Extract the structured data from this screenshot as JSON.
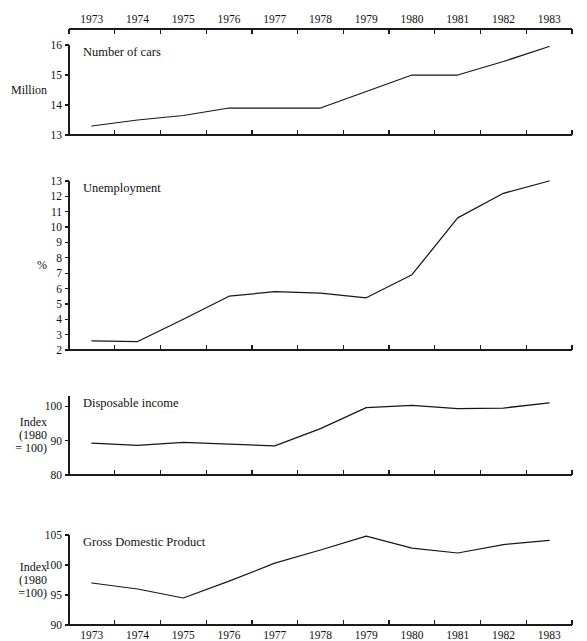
{
  "figure": {
    "background_color": "#ffffff",
    "line_color": "#17171a",
    "axis_color": "#1a1a1a",
    "years": [
      "1973",
      "1974",
      "1975",
      "1976",
      "1977",
      "1978",
      "1979",
      "1980",
      "1981",
      "1982",
      "1983"
    ],
    "top_axis_years": [
      "1973",
      "1974",
      "1975",
      "1976",
      "1977",
      "1978",
      "1979",
      "1980",
      "1981",
      "1982",
      "1983"
    ],
    "bottom_axis_years": [
      "1973",
      "1974",
      "1975",
      "1976",
      "1977",
      "1978",
      "1979",
      "1980",
      "1981",
      "1982",
      "1983"
    ]
  },
  "chart_data": [
    {
      "type": "line",
      "title": "Number of cars",
      "xlabel": "",
      "ylabel": "Million",
      "ylabel_lines": [
        "Million"
      ],
      "categories": [
        "1973",
        "1974",
        "1975",
        "1976",
        "1977",
        "1978",
        "1979",
        "1980",
        "1981",
        "1982",
        "1983"
      ],
      "values": [
        13.3,
        13.5,
        13.65,
        13.9,
        13.9,
        13.9,
        14.45,
        15.0,
        15.0,
        15.45,
        15.95
      ],
      "ylim": [
        13,
        16
      ],
      "yticks": [
        13,
        14,
        15,
        16
      ],
      "ytick_labels": [
        "13",
        "14",
        "15",
        "16"
      ],
      "grid": false,
      "legend": "none",
      "axis_position": "top"
    },
    {
      "type": "line",
      "title": "Unemployment",
      "xlabel": "",
      "ylabel": "%",
      "ylabel_lines": [
        "%"
      ],
      "categories": [
        "1973",
        "1974",
        "1975",
        "1976",
        "1977",
        "1978",
        "1979",
        "1980",
        "1981",
        "1982",
        "1983"
      ],
      "values": [
        2.6,
        2.55,
        4.0,
        5.5,
        5.8,
        5.7,
        5.4,
        6.9,
        10.6,
        12.2,
        13.0
      ],
      "ylim": [
        2,
        13
      ],
      "yticks": [
        2,
        3,
        4,
        5,
        6,
        7,
        8,
        9,
        10,
        11,
        12,
        13
      ],
      "ytick_labels": [
        "2",
        "3",
        "4",
        "5",
        "6",
        "7",
        "8",
        "9",
        "10",
        "11",
        "12",
        "13"
      ],
      "grid": false,
      "legend": "none",
      "axis_position": "none"
    },
    {
      "type": "line",
      "title": "Disposable income",
      "xlabel": "",
      "ylabel": "Index (1980 = 100)",
      "ylabel_lines": [
        "Index",
        "(1980",
        "= 100)"
      ],
      "categories": [
        "1973",
        "1974",
        "1975",
        "1976",
        "1977",
        "1978",
        "1979",
        "1980",
        "1981",
        "1982",
        "1983"
      ],
      "values": [
        89.3,
        88.6,
        89.5,
        89.0,
        88.5,
        93.5,
        99.6,
        100.3,
        99.3,
        99.5,
        101.0
      ],
      "ylim": [
        80,
        103
      ],
      "yticks": [
        80,
        90,
        100
      ],
      "ytick_labels": [
        "80",
        "90",
        "100"
      ],
      "grid": false,
      "legend": "none",
      "axis_position": "none"
    },
    {
      "type": "line",
      "title": "Gross Domestic Product",
      "xlabel": "",
      "ylabel": "Index (1980 = 100)",
      "ylabel_lines": [
        "Index",
        "(1980",
        "=100)"
      ],
      "categories": [
        "1973",
        "1974",
        "1975",
        "1976",
        "1977",
        "1978",
        "1979",
        "1980",
        "1981",
        "1982",
        "1983"
      ],
      "values": [
        97.0,
        96.0,
        94.5,
        97.3,
        100.3,
        102.5,
        104.8,
        102.8,
        102.0,
        103.4,
        104.1
      ],
      "ylim": [
        90,
        105
      ],
      "yticks": [
        90,
        95,
        100,
        105
      ],
      "ytick_labels": [
        "90",
        "95",
        "100",
        "105"
      ],
      "grid": false,
      "legend": "none",
      "axis_position": "bottom"
    }
  ]
}
